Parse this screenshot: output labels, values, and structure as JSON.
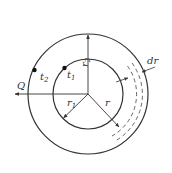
{
  "diagram": {
    "labels": {
      "heat_flow": "Q",
      "t1": "t",
      "t1_sub": "1",
      "t2": "t",
      "t2_sub": "2",
      "r1": "r",
      "r1_sub": "1",
      "r2": "r",
      "r2_sub": "2",
      "r": "r",
      "dr": "dr"
    },
    "colors": {
      "stroke": "#333333",
      "background": "#ffffff"
    },
    "geometry": {
      "center": [
        88,
        94
      ],
      "outer_radius": 60,
      "inner_radius": 35
    }
  }
}
